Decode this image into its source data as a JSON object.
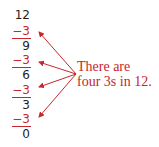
{
  "subtraction": {
    "start": "12",
    "steps": [
      {
        "subtract": "−3",
        "result": "9"
      },
      {
        "subtract": "−3",
        "result": "6"
      },
      {
        "subtract": "−3",
        "result": "3"
      },
      {
        "subtract": "−3",
        "result": "0"
      }
    ]
  },
  "annotation": {
    "line1": "There are",
    "line2": "four 3s in 12."
  },
  "colors": {
    "accent": "#c8262c",
    "text": "#231f20"
  }
}
